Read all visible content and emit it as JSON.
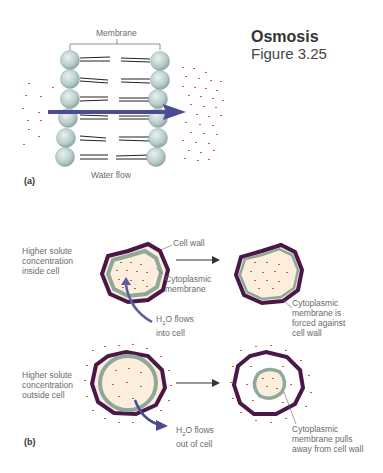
{
  "header": {
    "title": "Osmosis",
    "subtitle": "Figure 3.25"
  },
  "panel_a": {
    "label": "(a)",
    "membrane_label": "Membrane",
    "flow_label": "Water flow"
  },
  "panel_b": {
    "label": "(b)",
    "top_row": {
      "left_label": "Higher solute\nconcentration\ninside cell",
      "cell_wall_label": "Cell wall",
      "membrane_label": "Cytoplasmic\nmembrane",
      "flow_label_main": "H",
      "flow_label_sub": "2",
      "flow_label_rest": "O flows\ninto cell",
      "result_label": "Cytoplasmic\nmembrane is\nforced against\ncell wall"
    },
    "bottom_row": {
      "left_label": "Higher solute\nconcentration\noutside cell",
      "flow_label_main": "H",
      "flow_label_sub": "2",
      "flow_label_rest": "O flows\nout of cell",
      "result_label": "Cytoplasmic\nmembrane pulls\naway from cell wall"
    }
  },
  "colors": {
    "cell_wall": "#4a1848",
    "membrane": "#8fa89a",
    "cytoplasm": "#fbeedd",
    "solute": "#e0553a",
    "arrow": "#4a4d94",
    "phospholipid_head": "#b9cfcd"
  }
}
